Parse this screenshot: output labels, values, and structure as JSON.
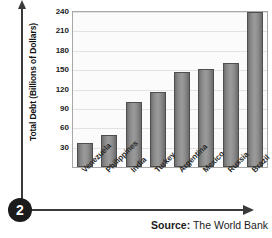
{
  "step_badge": "2",
  "source": {
    "label": "Source:",
    "text": " The World Bank"
  },
  "chart_data": {
    "type": "bar",
    "title": "",
    "xlabel": "",
    "ylabel": "Total Debt (Billions of Dollars)",
    "ylim": [
      0,
      240
    ],
    "yticks": [
      30,
      60,
      90,
      120,
      150,
      180,
      210,
      240
    ],
    "grid": true,
    "legend": "none",
    "categories": [
      "Venezuela",
      "Philippines",
      "India",
      "Turkey",
      "Argentina",
      "Mexico",
      "Russia",
      "Brazil"
    ],
    "values": [
      37,
      50,
      100,
      116,
      147,
      151,
      161,
      240
    ],
    "bar_color": "#8f8f8f",
    "bar_edge_color": "#4e4e4e",
    "source_note": "Source: The World Bank"
  }
}
